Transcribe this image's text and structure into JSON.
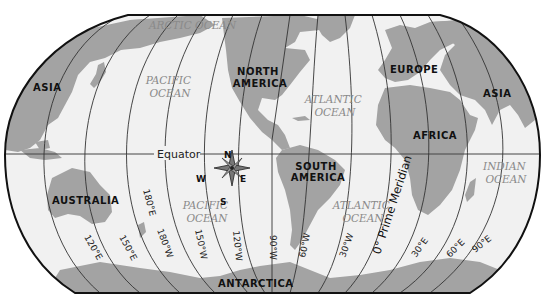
{
  "map": {
    "projection": "Robinson",
    "colors": {
      "land": "#a3a3a3",
      "ocean": "#f1f1f1",
      "grid": "#333333",
      "outline": "#111111"
    },
    "continents": [
      {
        "id": "asia-west",
        "label": "ASIA"
      },
      {
        "id": "north-america",
        "label": "NORTH\nAMERICA",
        "lines": [
          "NORTH",
          "AMERICA"
        ]
      },
      {
        "id": "europe",
        "label": "EUROPE"
      },
      {
        "id": "asia-east",
        "label": "ASIA"
      },
      {
        "id": "africa",
        "label": "AFRICA"
      },
      {
        "id": "south-america",
        "lines": [
          "SOUTH",
          "AMERICA"
        ]
      },
      {
        "id": "australia",
        "label": "AUSTRALIA"
      },
      {
        "id": "antarctica",
        "label": "ANTARCTICA"
      }
    ],
    "oceans": [
      {
        "id": "arctic",
        "lines": [
          "ARCTIC OCEAN"
        ]
      },
      {
        "id": "pacific-north",
        "lines": [
          "PACIFIC",
          "OCEAN"
        ]
      },
      {
        "id": "atlantic-north",
        "lines": [
          "ATLANTIC",
          "OCEAN"
        ]
      },
      {
        "id": "pacific-south",
        "lines": [
          "PACIFIC",
          "OCEAN"
        ]
      },
      {
        "id": "atlantic-south",
        "lines": [
          "ATLANTIC",
          "OCEAN"
        ]
      },
      {
        "id": "indian",
        "lines": [
          "INDIAN",
          "OCEAN"
        ]
      }
    ],
    "equator_label": "Equator",
    "prime_meridian_label": "0° Prime Meridian",
    "meridian_labels": [
      "120°E",
      "150°E",
      "180°E",
      "180°W",
      "150°W",
      "120°W",
      "90°W",
      "60°W",
      "30°W",
      "30°E",
      "60°E",
      "90°E"
    ],
    "compass": {
      "n": "N",
      "s": "S",
      "e": "E",
      "w": "W"
    }
  }
}
